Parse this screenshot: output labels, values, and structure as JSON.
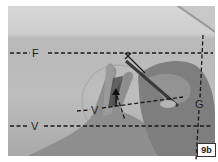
{
  "figure": {
    "badge_label": "9b",
    "lines": {
      "top_horizontal_label": "F",
      "bottom_horizontal_label": "V",
      "middle_angled_label": "V",
      "vertical_label": "G"
    },
    "marker": "X"
  },
  "colors": {
    "line": "#1a1a1a",
    "paper": "#c4c4c4",
    "skin": "#8a8a8a",
    "badge_bg": "#ffffff"
  }
}
